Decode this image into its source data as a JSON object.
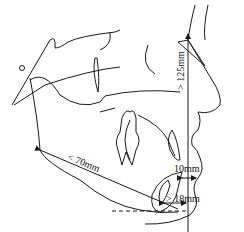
{
  "figure": {
    "measurements": {
      "vertical_face": "> 125mm",
      "ramus": "< 70mm",
      "lip_to_line": "10mm",
      "chin_to_line": "> 18mm"
    },
    "colors": {
      "line": "#1a1a1a",
      "background": "#ffffff"
    }
  }
}
